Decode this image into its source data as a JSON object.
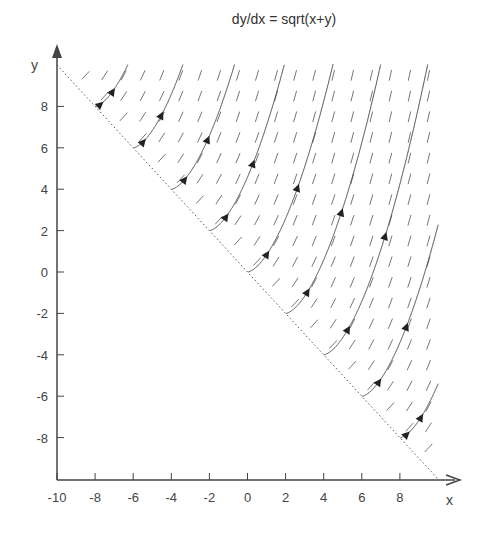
{
  "chart_data": {
    "type": "direction_field",
    "title": "dy/dx = sqrt(x+y)",
    "xlabel": "x",
    "ylabel": "y",
    "xlim": [
      -10,
      10
    ],
    "ylim": [
      -10,
      10
    ],
    "xticks": [
      -10,
      -8,
      -6,
      -4,
      -2,
      0,
      2,
      4,
      6,
      8
    ],
    "yticks": [
      8,
      6,
      4,
      2,
      0,
      -2,
      -4,
      -6,
      -8
    ],
    "domain_boundary": {
      "equation": "x + y = 0",
      "style": "dotted",
      "from": [
        -10,
        10
      ],
      "to": [
        10,
        -10
      ]
    },
    "field": "slope segments of sqrt(x+y) on grid where x+y >= 0",
    "grid": false,
    "streamline_starts": [
      [
        -8,
        8
      ],
      [
        -6,
        6
      ],
      [
        -4,
        4
      ],
      [
        -2,
        2
      ],
      [
        0,
        0
      ],
      [
        2,
        -2
      ],
      [
        4,
        -4
      ],
      [
        6,
        -6
      ],
      [
        8,
        -8
      ]
    ]
  },
  "title": "dy/dx = sqrt(x+y)",
  "axes": {
    "x_label": "x",
    "y_label": "y"
  }
}
